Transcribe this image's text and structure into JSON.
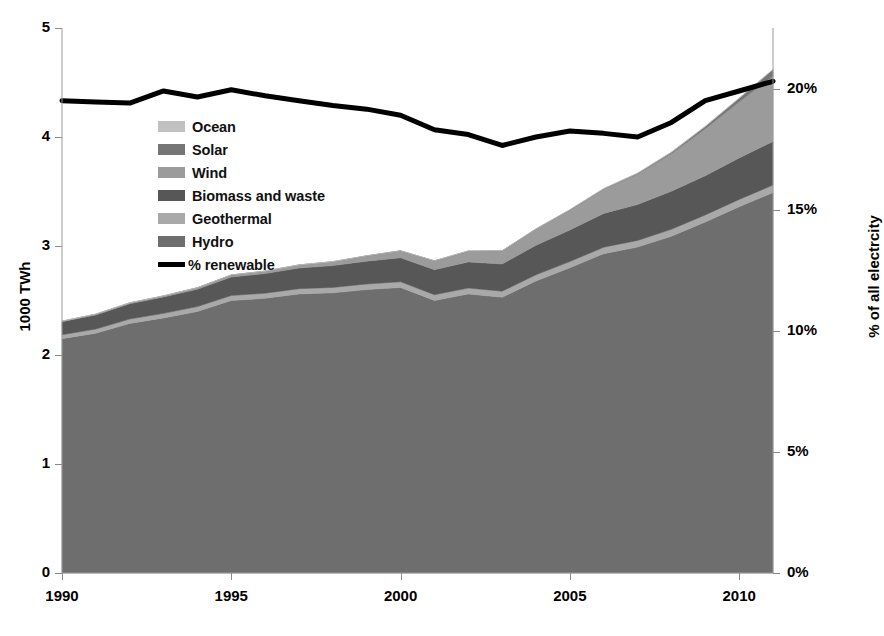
{
  "chart_data": {
    "type": "area",
    "title": "",
    "subtitle": "",
    "xlabel": "",
    "ylabel": "1000 TWh",
    "y2label": "% of all electrcity",
    "xlim": [
      1990,
      2011
    ],
    "ylim": [
      0,
      5
    ],
    "y2lim": [
      0,
      22.5
    ],
    "grid": false,
    "legend_position": "upper-left-inside",
    "stacked": true,
    "x": [
      1990,
      1991,
      1992,
      1993,
      1994,
      1995,
      1996,
      1997,
      1998,
      1999,
      2000,
      2001,
      2002,
      2003,
      2004,
      2005,
      2006,
      2007,
      2008,
      2009,
      2010,
      2011
    ],
    "xticks": [
      1990,
      1995,
      2000,
      2005,
      2010
    ],
    "xticklabels": [
      "1990",
      "1995",
      "2000",
      "2005",
      "2010"
    ],
    "yticks": [
      0,
      1,
      2,
      3,
      4,
      5
    ],
    "yticklabels": [
      "0",
      "1",
      "2",
      "3",
      "4",
      "5"
    ],
    "y2ticks": [
      0,
      5,
      10,
      15,
      20
    ],
    "y2ticklabels": [
      "0%",
      "5%",
      "10%",
      "15%",
      "20%"
    ],
    "series": [
      {
        "name": "Hydro",
        "color": "#6e6e6e",
        "stack_order": 1,
        "values": [
          2.15,
          2.2,
          2.29,
          2.34,
          2.4,
          2.5,
          2.52,
          2.56,
          2.57,
          2.6,
          2.62,
          2.5,
          2.56,
          2.53,
          2.68,
          2.8,
          2.93,
          2.99,
          3.09,
          3.22,
          3.36,
          3.49
        ]
      },
      {
        "name": "Geothermal",
        "color": "#a9a9a9",
        "stack_order": 2,
        "values": [
          0.036,
          0.038,
          0.04,
          0.042,
          0.044,
          0.046,
          0.047,
          0.048,
          0.05,
          0.051,
          0.052,
          0.053,
          0.054,
          0.055,
          0.056,
          0.057,
          0.059,
          0.061,
          0.063,
          0.065,
          0.067,
          0.069
        ]
      },
      {
        "name": "Biomass and waste",
        "color": "#575757",
        "stack_order": 3,
        "values": [
          0.12,
          0.13,
          0.14,
          0.15,
          0.16,
          0.17,
          0.18,
          0.19,
          0.2,
          0.21,
          0.22,
          0.23,
          0.24,
          0.25,
          0.27,
          0.29,
          0.31,
          0.33,
          0.35,
          0.36,
          0.38,
          0.4
        ]
      },
      {
        "name": "Wind",
        "color": "#9b9b9b",
        "stack_order": 4,
        "values": [
          0.004,
          0.006,
          0.008,
          0.01,
          0.013,
          0.018,
          0.022,
          0.028,
          0.036,
          0.048,
          0.063,
          0.08,
          0.098,
          0.119,
          0.148,
          0.181,
          0.222,
          0.279,
          0.345,
          0.431,
          0.516,
          0.6
        ]
      },
      {
        "name": "Solar",
        "color": "#767676",
        "stack_order": 5,
        "values": [
          0.0,
          0.0,
          0.0,
          0.0,
          0.0,
          0.0,
          0.0,
          0.0,
          0.0,
          0.001,
          0.001,
          0.001,
          0.002,
          0.002,
          0.003,
          0.004,
          0.005,
          0.007,
          0.012,
          0.021,
          0.033,
          0.06
        ]
      },
      {
        "name": "Ocean",
        "color": "#c0c0c0",
        "stack_order": 6,
        "values": [
          0.001,
          0.001,
          0.001,
          0.001,
          0.001,
          0.001,
          0.001,
          0.001,
          0.001,
          0.001,
          0.001,
          0.001,
          0.001,
          0.001,
          0.001,
          0.001,
          0.001,
          0.001,
          0.001,
          0.001,
          0.001,
          0.001
        ]
      }
    ],
    "line_series": {
      "name": "% renewable",
      "color": "#000000",
      "axis": "y2",
      "unit": "%",
      "values": [
        19.5,
        19.45,
        19.4,
        19.9,
        19.65,
        19.95,
        19.7,
        19.5,
        19.3,
        19.15,
        18.9,
        18.3,
        18.1,
        17.65,
        18.0,
        18.25,
        18.15,
        18.0,
        18.6,
        19.5,
        19.9,
        20.3
      ]
    }
  },
  "legend": {
    "items": [
      {
        "label": "Ocean",
        "color": "#c0c0c0",
        "marker": "swatch"
      },
      {
        "label": "Solar",
        "color": "#767676",
        "marker": "swatch"
      },
      {
        "label": "Wind",
        "color": "#9b9b9b",
        "marker": "swatch"
      },
      {
        "label": "Biomass and waste",
        "color": "#575757",
        "marker": "swatch"
      },
      {
        "label": "Geothermal",
        "color": "#a9a9a9",
        "marker": "swatch"
      },
      {
        "label": "Hydro",
        "color": "#6e6e6e",
        "marker": "swatch"
      },
      {
        "label": "% renewable",
        "color": "#000000",
        "marker": "line"
      }
    ]
  },
  "axes": {
    "left_title": "1000 TWh",
    "right_title": "% of all electrcity"
  }
}
